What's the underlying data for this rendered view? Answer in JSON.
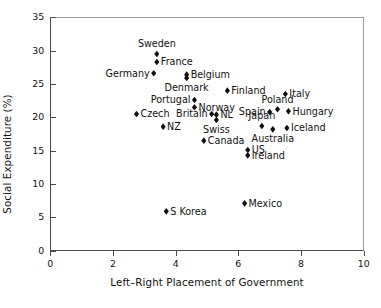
{
  "chart_data": {
    "type": "scatter",
    "title": "",
    "xlabel": "Left–Right Placement of Government",
    "ylabel": "Social Expenditure (%)",
    "xlim": [
      0,
      10
    ],
    "ylim": [
      0,
      35
    ],
    "xticks": [
      "0",
      "2",
      "4",
      "6",
      "8",
      "10"
    ],
    "yticks": [
      "0",
      "5",
      "10",
      "15",
      "20",
      "25",
      "30",
      "35"
    ],
    "grid": false,
    "legend": "none",
    "marker": "filled-diamond",
    "marker_color": "#111111",
    "points": [
      {
        "label": "Sweden",
        "x": 3.4,
        "y": 29.5,
        "pos": "above"
      },
      {
        "label": "France",
        "x": 3.4,
        "y": 28.3,
        "pos": "right"
      },
      {
        "label": "Germany",
        "x": 3.3,
        "y": 26.6,
        "pos": "left"
      },
      {
        "label": "Belgium",
        "x": 4.35,
        "y": 26.4,
        "pos": "right"
      },
      {
        "label": "Denmark",
        "x": 4.35,
        "y": 25.9,
        "pos": "below"
      },
      {
        "label": "Finland",
        "x": 5.65,
        "y": 24.0,
        "pos": "right"
      },
      {
        "label": "Italy",
        "x": 7.5,
        "y": 23.5,
        "pos": "right"
      },
      {
        "label": "Portugal",
        "x": 4.6,
        "y": 22.6,
        "pos": "left"
      },
      {
        "label": "Norway",
        "x": 4.6,
        "y": 21.5,
        "pos": "right"
      },
      {
        "label": "Poland",
        "x": 7.25,
        "y": 21.2,
        "pos": "above"
      },
      {
        "label": "Hungary",
        "x": 7.6,
        "y": 20.9,
        "pos": "right"
      },
      {
        "label": "Spain",
        "x": 7.0,
        "y": 20.8,
        "pos": "left"
      },
      {
        "label": "Britain",
        "x": 5.15,
        "y": 20.5,
        "pos": "left"
      },
      {
        "label": "NL",
        "x": 5.3,
        "y": 20.4,
        "pos": "right"
      },
      {
        "label": "Czech",
        "x": 2.75,
        "y": 20.5,
        "pos": "right"
      },
      {
        "label": "Swiss",
        "x": 5.3,
        "y": 19.6,
        "pos": "below"
      },
      {
        "label": "Japan",
        "x": 6.75,
        "y": 18.7,
        "pos": "above"
      },
      {
        "label": "NZ",
        "x": 3.6,
        "y": 18.6,
        "pos": "right"
      },
      {
        "label": "Iceland",
        "x": 7.55,
        "y": 18.4,
        "pos": "right"
      },
      {
        "label": "Australia",
        "x": 7.1,
        "y": 18.2,
        "pos": "below"
      },
      {
        "label": "Canada",
        "x": 4.9,
        "y": 16.5,
        "pos": "right"
      },
      {
        "label": "US",
        "x": 6.3,
        "y": 15.1,
        "pos": "right"
      },
      {
        "label": "Ireland",
        "x": 6.3,
        "y": 14.3,
        "pos": "right"
      },
      {
        "label": "Mexico",
        "x": 6.2,
        "y": 7.1,
        "pos": "right"
      },
      {
        "label": "S Korea",
        "x": 3.7,
        "y": 5.9,
        "pos": "right"
      }
    ]
  }
}
